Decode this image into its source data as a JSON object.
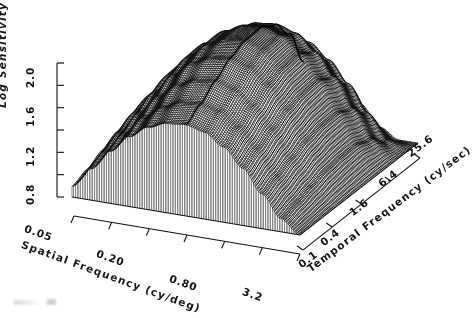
{
  "figure": {
    "kind": "3d-surface-wireframe",
    "background_color": "#ffffff",
    "ink_color": "#101010"
  },
  "chart_data": {
    "type": "line",
    "render_as": "3d-wireframe-surface",
    "title": "",
    "subtitle": "",
    "xlabel": "Spatial Frequency (cy/deg)",
    "ylabel": "Log Sensitivity",
    "zlabel": "Temporal Frequency (cy/sec)",
    "grid": false,
    "legend": "none",
    "annotations": [
      "dark ridge line along surface crest"
    ],
    "x_axis": {
      "label": "Spatial Frequency (cy/deg)",
      "scale": "log",
      "ticks": [
        "0.05",
        "0.20",
        "0.80",
        "3.2"
      ],
      "tick_values": [
        0.05,
        0.2,
        0.8,
        3.2
      ],
      "range": [
        0.05,
        3.2
      ]
    },
    "y_axis": {
      "label": "Log Sensitivity",
      "scale": "linear",
      "ticks": [
        "0.8",
        "1.2",
        "1.6",
        "2.0"
      ],
      "tick_values": [
        0.8,
        1.2,
        1.6,
        2.0
      ],
      "range": [
        0.6,
        2.1
      ],
      "minor_ticks": 7
    },
    "z_axis": {
      "label": "Temporal Frequency (cy/sec)",
      "scale": "log",
      "ticks": [
        "0.1",
        "0.4",
        "1.6",
        "6.4",
        "25.6"
      ],
      "tick_values": [
        0.1,
        0.4,
        1.6,
        6.4,
        25.6
      ],
      "range": [
        0.1,
        25.6
      ]
    },
    "x": [
      0.05,
      0.0707,
      0.1,
      0.1414,
      0.2,
      0.2828,
      0.4,
      0.5657,
      0.8,
      1.1314,
      1.6,
      2.2627,
      3.2
    ],
    "z": [
      0.1,
      0.2,
      0.4,
      0.8,
      1.6,
      3.2,
      6.4,
      12.8,
      25.6
    ],
    "series": [
      {
        "name": "0.1 cy/sec",
        "values": [
          0.72,
          0.95,
          1.18,
          1.38,
          1.52,
          1.6,
          1.62,
          1.57,
          1.44,
          1.24,
          0.99,
          0.75,
          0.6
        ]
      },
      {
        "name": "0.2 cy/sec",
        "values": [
          0.78,
          1.02,
          1.26,
          1.47,
          1.62,
          1.71,
          1.73,
          1.68,
          1.54,
          1.33,
          1.06,
          0.8,
          0.6
        ]
      },
      {
        "name": "0.4 cy/sec",
        "values": [
          0.86,
          1.11,
          1.36,
          1.58,
          1.74,
          1.83,
          1.86,
          1.8,
          1.65,
          1.42,
          1.13,
          0.85,
          0.6
        ]
      },
      {
        "name": "0.8 cy/sec",
        "values": [
          0.94,
          1.2,
          1.46,
          1.69,
          1.86,
          1.95,
          1.98,
          1.92,
          1.76,
          1.51,
          1.2,
          0.9,
          0.6
        ]
      },
      {
        "name": "1.6 cy/sec",
        "values": [
          1.0,
          1.26,
          1.53,
          1.76,
          1.93,
          2.03,
          2.05,
          1.99,
          1.82,
          1.56,
          1.24,
          0.92,
          0.6
        ]
      },
      {
        "name": "3.2 cy/sec",
        "values": [
          1.01,
          1.27,
          1.54,
          1.77,
          1.94,
          2.04,
          2.06,
          2.0,
          1.83,
          1.57,
          1.24,
          0.92,
          0.6
        ]
      },
      {
        "name": "6.4 cy/sec",
        "values": [
          0.96,
          1.21,
          1.47,
          1.69,
          1.86,
          1.95,
          1.97,
          1.91,
          1.74,
          1.49,
          1.17,
          0.86,
          0.6
        ]
      },
      {
        "name": "12.8 cy/sec",
        "values": [
          0.84,
          1.07,
          1.3,
          1.5,
          1.65,
          1.73,
          1.74,
          1.68,
          1.52,
          1.29,
          1.0,
          0.72,
          0.6
        ]
      },
      {
        "name": "25.6 cy/sec",
        "values": [
          0.63,
          0.8,
          0.98,
          1.12,
          1.23,
          1.29,
          1.3,
          1.25,
          1.12,
          0.93,
          0.71,
          0.6,
          0.6
        ]
      }
    ],
    "floor_value": 0.6,
    "peak": {
      "x": 0.4,
      "z": 3.2,
      "y": 2.06
    }
  },
  "axes": {
    "y_title": "Log Sensitivity",
    "y_ticks": [
      "0.8",
      "1.2",
      "1.6",
      "2.0"
    ],
    "x_title_part1": "Spatial",
    "x_title_part2": "Frequency",
    "x_title_part3": "(cy/deg)",
    "x_title_full": "Spatial Frequency (cy/deg)",
    "x_ticks": [
      "0.05",
      "0.20",
      "0.80",
      "3.2"
    ],
    "z_title": "Temporal Frequency (cy/sec)",
    "z_ticks": [
      "0.1",
      "0.4",
      "1.6",
      "6.4",
      "25.6"
    ]
  }
}
